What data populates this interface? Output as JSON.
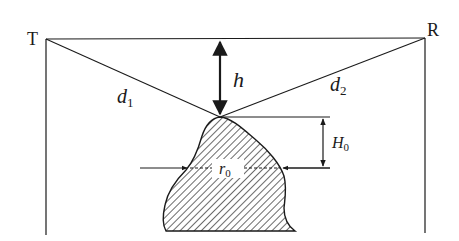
{
  "diagram": {
    "type": "knife-edge diffraction obstacle geometry",
    "labels": {
      "transmitter": "T",
      "receiver": "R",
      "distance_1": "d",
      "distance_1_sub": "1",
      "distance_2": "d",
      "distance_2_sub": "2",
      "clearance": "h",
      "height": "H",
      "height_sub": "0",
      "radius": "r",
      "radius_sub": "0"
    },
    "colors": {
      "line": "#1a1a1a",
      "background": "#ffffff"
    }
  }
}
